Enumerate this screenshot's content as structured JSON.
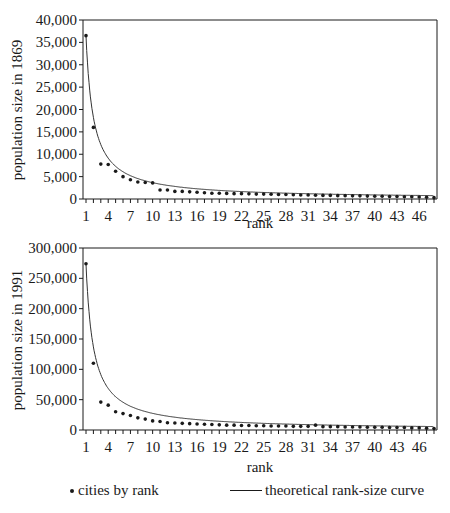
{
  "colors": {
    "axis": "#1a1a1a",
    "points": "#1a1a1a",
    "curve": "#333333",
    "background": "#ffffff"
  },
  "legend": {
    "points_label": "cities by rank",
    "curve_label": "theoretical rank-size curve",
    "points_icon": "bullet-dot",
    "curve_icon": "solid-line"
  },
  "chart_data": [
    {
      "type": "scatter",
      "title": "",
      "xlabel": "rank",
      "ylabel": "population size in 1869",
      "ylim": [
        0,
        40000
      ],
      "yticks": [
        0,
        5000,
        10000,
        15000,
        20000,
        25000,
        30000,
        35000,
        40000
      ],
      "ytick_labels": [
        "0",
        "5,000",
        "10,000",
        "15,000",
        "20,000",
        "25,000",
        "30,000",
        "35,000",
        "40,000"
      ],
      "xlim": [
        1,
        48
      ],
      "xtick_labels": [
        "1",
        "4",
        "7",
        "10",
        "13",
        "16",
        "19",
        "22",
        "25",
        "28",
        "31",
        "34",
        "37",
        "40",
        "43",
        "46"
      ],
      "grid": false,
      "series": [
        {
          "name": "cities by rank",
          "style": "points",
          "x": [
            1,
            2,
            3,
            4,
            5,
            6,
            7,
            8,
            9,
            10,
            11,
            12,
            13,
            14,
            15,
            16,
            17,
            18,
            19,
            20,
            21,
            22,
            23,
            24,
            25,
            26,
            27,
            28,
            29,
            30,
            31,
            32,
            33,
            34,
            35,
            36,
            37,
            38,
            39,
            40,
            41,
            42,
            43,
            44,
            45,
            46,
            47,
            48
          ],
          "values": [
            36500,
            16000,
            7800,
            7700,
            6200,
            5000,
            4300,
            3800,
            3700,
            3600,
            2000,
            2000,
            1700,
            1700,
            1600,
            1500,
            1400,
            1300,
            1300,
            1250,
            1200,
            1200,
            1150,
            1100,
            1100,
            1050,
            1000,
            1000,
            950,
            900,
            900,
            850,
            800,
            800,
            750,
            750,
            700,
            700,
            650,
            600,
            600,
            550,
            550,
            500,
            500,
            450,
            400,
            300
          ]
        },
        {
          "name": "theoretical rank-size curve",
          "style": "line",
          "formula": "36500 / rank"
        }
      ]
    },
    {
      "type": "scatter",
      "title": "",
      "xlabel": "rank",
      "ylabel": "population size in 1991",
      "ylim": [
        0,
        300000
      ],
      "yticks": [
        0,
        50000,
        100000,
        150000,
        200000,
        250000,
        300000
      ],
      "ytick_labels": [
        "0",
        "50,000",
        "100,000",
        "150,000",
        "200,000",
        "250,000",
        "300,000"
      ],
      "xlim": [
        1,
        48
      ],
      "xtick_labels": [
        "1",
        "4",
        "7",
        "10",
        "13",
        "16",
        "19",
        "22",
        "25",
        "28",
        "31",
        "34",
        "37",
        "40",
        "43",
        "46"
      ],
      "grid": false,
      "series": [
        {
          "name": "cities by rank",
          "style": "points",
          "x": [
            1,
            2,
            3,
            4,
            5,
            6,
            7,
            8,
            9,
            10,
            11,
            12,
            13,
            14,
            15,
            16,
            17,
            18,
            19,
            20,
            21,
            22,
            23,
            24,
            25,
            26,
            27,
            28,
            29,
            30,
            31,
            32,
            33,
            34,
            35,
            36,
            37,
            38,
            39,
            40,
            41,
            42,
            43,
            44,
            45,
            46,
            47,
            48
          ],
          "values": [
            274000,
            110000,
            46000,
            41000,
            30000,
            27000,
            24000,
            20000,
            18000,
            15000,
            14000,
            12000,
            11500,
            11000,
            10500,
            10000,
            9500,
            9000,
            8500,
            8000,
            8000,
            7500,
            7500,
            7000,
            7000,
            6500,
            6500,
            6500,
            6000,
            6000,
            6000,
            8000,
            5500,
            5500,
            5500,
            5000,
            5000,
            5000,
            4500,
            4500,
            4500,
            4000,
            4000,
            4000,
            3500,
            3500,
            3000,
            2500
          ]
        },
        {
          "name": "theoretical rank-size curve",
          "style": "line",
          "formula": "274000 / rank"
        }
      ]
    }
  ]
}
